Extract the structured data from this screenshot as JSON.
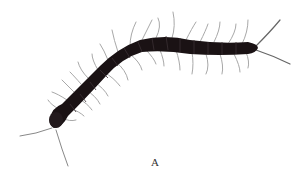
{
  "figure": {
    "caption": "A",
    "colors": {
      "body": "#1a1214",
      "legs": "#9a9a9a",
      "background": "#ffffff"
    }
  }
}
